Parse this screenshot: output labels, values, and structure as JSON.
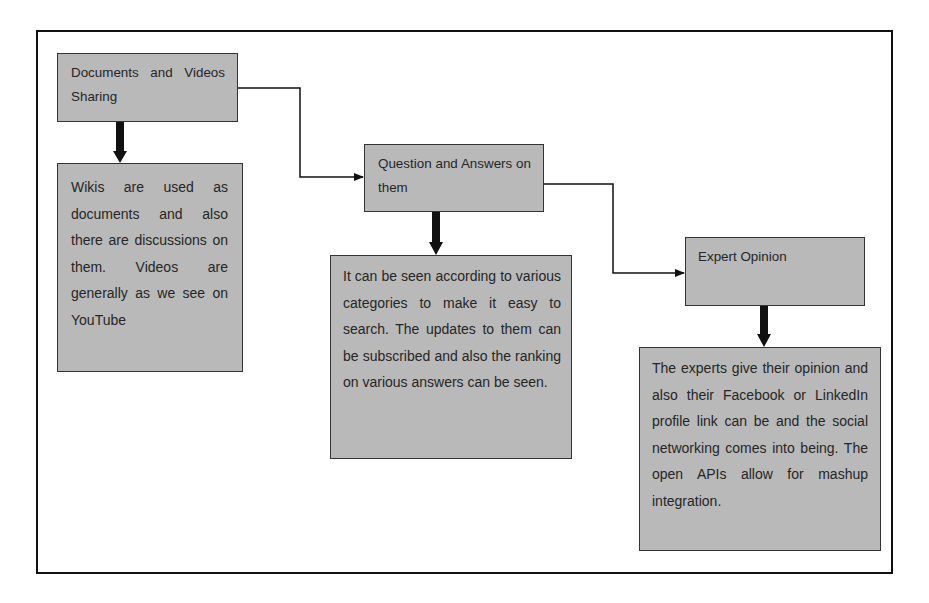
{
  "diagram": {
    "type": "flowchart",
    "colors": {
      "box_fill": "#b9b9b9",
      "box_border": "#333333",
      "text": "#262626",
      "frame_border": "#111111",
      "arrow": "#111111"
    },
    "nodes": [
      {
        "id": "documents-videos",
        "label": "Documents and Videos Sharing"
      },
      {
        "id": "documents-videos-desc",
        "label": "Wikis are used as documents and also there are discussions on them. Videos are generally as we see on YouTube"
      },
      {
        "id": "question-answers",
        "label": "Question and Answers on them"
      },
      {
        "id": "question-answers-desc",
        "label": "It can be seen according to various categories to make it easy to search. The updates to them can be subscribed and also the ranking on various answers can be seen."
      },
      {
        "id": "expert-opinion",
        "label": "Expert Opinion"
      },
      {
        "id": "expert-opinion-desc",
        "label": "The experts give their opinion and also their Facebook or LinkedIn profile link can be and the social networking comes into being. The open APIs allow for mashup integration."
      }
    ],
    "edges": [
      {
        "from": "documents-videos",
        "to": "documents-videos-desc",
        "style": "thick"
      },
      {
        "from": "documents-videos",
        "to": "question-answers",
        "style": "thin-elbow"
      },
      {
        "from": "question-answers",
        "to": "question-answers-desc",
        "style": "thick"
      },
      {
        "from": "question-answers",
        "to": "expert-opinion",
        "style": "thin-elbow"
      },
      {
        "from": "expert-opinion",
        "to": "expert-opinion-desc",
        "style": "thick"
      }
    ]
  }
}
